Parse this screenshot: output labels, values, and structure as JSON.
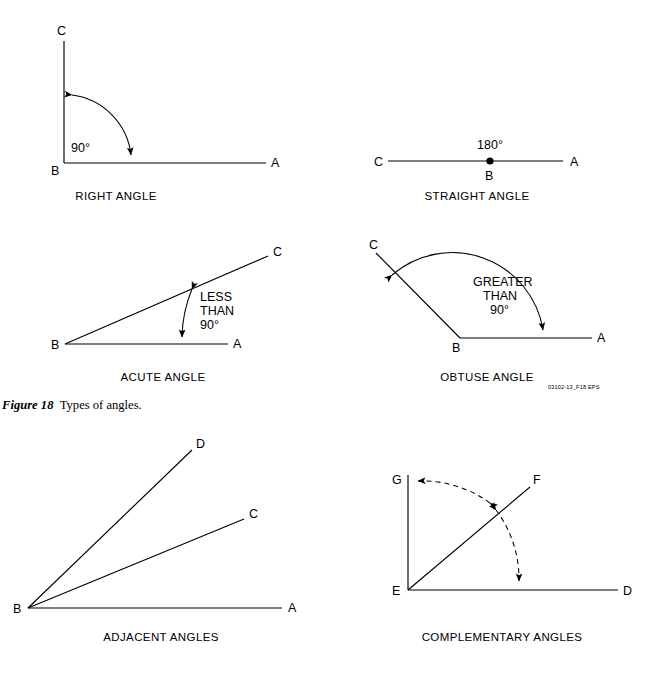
{
  "figure": {
    "caption_id": "Figure 18",
    "caption_text": "Types of angles.",
    "eps_code": "03102-13_F18.EPS"
  },
  "panels": [
    {
      "key": "right_angle",
      "title": "RIGHT ANGLE",
      "vertex_labels": [
        "C",
        "B",
        "A"
      ],
      "annotation": "90°"
    },
    {
      "key": "straight_angle",
      "title": "STRAIGHT ANGLE",
      "vertex_labels": [
        "C",
        "B",
        "A"
      ],
      "annotation": "180°"
    },
    {
      "key": "acute_angle",
      "title": "ACUTE ANGLE",
      "vertex_labels": [
        "C",
        "B",
        "A"
      ],
      "annotation_lines": [
        "LESS",
        "THAN",
        "90°"
      ]
    },
    {
      "key": "obtuse_angle",
      "title": "OBTUSE ANGLE",
      "vertex_labels": [
        "C",
        "B",
        "A"
      ],
      "annotation_lines": [
        "GREATER",
        "THAN",
        "90°"
      ]
    },
    {
      "key": "adjacent_angles",
      "title": "ADJACENT ANGLES",
      "vertex_labels": [
        "D",
        "C",
        "B",
        "A"
      ]
    },
    {
      "key": "complementary_angles",
      "title": "COMPLEMENTARY ANGLES",
      "vertex_labels": [
        "G",
        "F",
        "E",
        "D"
      ]
    }
  ],
  "labels": {
    "right_C": "C",
    "right_B": "B",
    "right_A": "A",
    "right_deg": "90°",
    "right_title": "RIGHT ANGLE",
    "straight_C": "C",
    "straight_B": "B",
    "straight_A": "A",
    "straight_deg": "180°",
    "straight_title": "STRAIGHT ANGLE",
    "acute_C": "C",
    "acute_B": "B",
    "acute_A": "A",
    "acute_n1": "LESS",
    "acute_n2": "THAN",
    "acute_n3": "90°",
    "acute_title": "ACUTE ANGLE",
    "obtuse_C": "C",
    "obtuse_B": "B",
    "obtuse_A": "A",
    "obtuse_n1": "GREATER",
    "obtuse_n2": "THAN",
    "obtuse_n3": "90°",
    "obtuse_title": "OBTUSE ANGLE",
    "adj_D": "D",
    "adj_C": "C",
    "adj_B": "B",
    "adj_A": "A",
    "adj_title": "ADJACENT ANGLES",
    "comp_G": "G",
    "comp_F": "F",
    "comp_E": "E",
    "comp_D": "D",
    "comp_title": "COMPLEMENTARY ANGLES"
  }
}
